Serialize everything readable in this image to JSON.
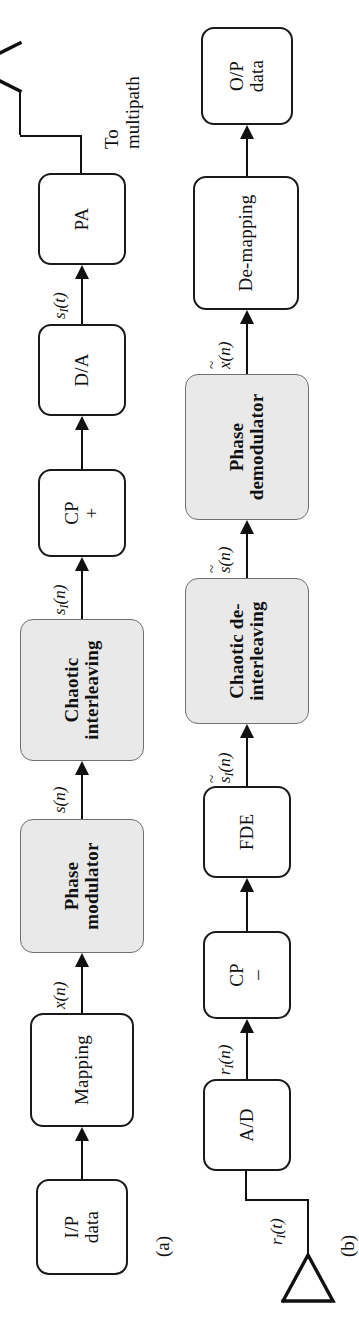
{
  "figure": {
    "type": "block-diagram",
    "orientation": "rotated-90-ccw",
    "captions": {
      "a": "(a)",
      "b": "(b)"
    },
    "colors": {
      "stroke": "#111111",
      "shaded_fill": "#e9e9e9",
      "shaded_stroke": "#6f6f6f",
      "background": "#ffffff"
    }
  },
  "transmitter": {
    "caption": "(a)",
    "blocks": [
      {
        "id": "ip-data",
        "lines": [
          "I/P",
          "data"
        ],
        "shaded": false
      },
      {
        "id": "mapping",
        "lines": [
          "Mapping"
        ],
        "shaded": false
      },
      {
        "id": "phase-modulator",
        "lines": [
          "Phase",
          "modulator"
        ],
        "shaded": true
      },
      {
        "id": "chaotic-interleaving",
        "lines": [
          "Chaotic",
          "interleaving"
        ],
        "shaded": true
      },
      {
        "id": "cp-add",
        "lines": [
          "CP",
          "+"
        ],
        "shaded": false
      },
      {
        "id": "dac",
        "lines": [
          "D/A"
        ],
        "shaded": false
      },
      {
        "id": "pa",
        "lines": [
          "PA"
        ],
        "shaded": false
      }
    ],
    "signals": [
      {
        "id": "x-n",
        "base": "x",
        "sub": "",
        "arg": "(n)",
        "tilde": false
      },
      {
        "id": "s-n",
        "base": "s",
        "sub": "",
        "arg": "(n)",
        "tilde": false
      },
      {
        "id": "sI-n",
        "base": "s",
        "sub": "I",
        "arg": "(n)",
        "tilde": false
      },
      {
        "id": "sI-t",
        "base": "s",
        "sub": "I",
        "arg": "(t)",
        "tilde": false
      }
    ],
    "output_label": [
      "To",
      "multipath"
    ],
    "antenna": "transmit-antenna"
  },
  "receiver": {
    "caption": "(b)",
    "blocks": [
      {
        "id": "adc",
        "lines": [
          "A/D"
        ],
        "shaded": false
      },
      {
        "id": "cp-remove",
        "lines": [
          "CP",
          "–"
        ],
        "shaded": false
      },
      {
        "id": "fde",
        "lines": [
          "FDE"
        ],
        "shaded": false
      },
      {
        "id": "chaotic-deinterleaving",
        "lines": [
          "Chaotic de-",
          "interleaving"
        ],
        "shaded": true
      },
      {
        "id": "phase-demodulator",
        "lines": [
          "Phase",
          "demodulator"
        ],
        "shaded": true
      },
      {
        "id": "de-mapping",
        "lines": [
          "De-mapping"
        ],
        "shaded": false
      },
      {
        "id": "op-data",
        "lines": [
          "O/P",
          "data"
        ],
        "shaded": false
      }
    ],
    "signals": [
      {
        "id": "rI-t",
        "base": "r",
        "sub": "I",
        "arg": "(t)",
        "tilde": false
      },
      {
        "id": "rI-n",
        "base": "r",
        "sub": "I",
        "arg": "(n)",
        "tilde": false
      },
      {
        "id": "sI-n-t",
        "base": "s",
        "sub": "I",
        "arg": "(n)",
        "tilde": true
      },
      {
        "id": "s-n-t",
        "base": "s",
        "sub": "",
        "arg": "(n)",
        "tilde": true
      },
      {
        "id": "x-n-t",
        "base": "x",
        "sub": "",
        "arg": "(n)",
        "tilde": true
      }
    ],
    "antenna": "receive-antenna"
  }
}
